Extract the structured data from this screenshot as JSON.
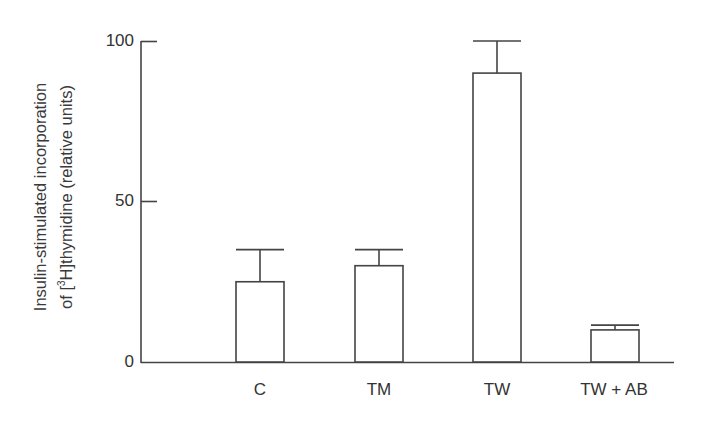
{
  "chart_data": {
    "type": "bar",
    "title": "",
    "xlabel": "",
    "ylabel_line1": "Insulin-stimulated incorporation",
    "ylabel_line2_prefix": "of [",
    "ylabel_sup": "3",
    "ylabel_line2_suffix": "H]thymidine (relative units)",
    "ylabel": "Insulin-stimulated incorporation of [3H]thymidine (relative units)",
    "categories": [
      "C",
      "TM",
      "TW",
      "TW + AB"
    ],
    "values": [
      25,
      30,
      90,
      10
    ],
    "error_upper": [
      35,
      35,
      100,
      11.5
    ],
    "yticks": [
      "0",
      "50",
      "100"
    ],
    "ylim": [
      0,
      100
    ],
    "grid": false,
    "legend": null,
    "bar_fill": "#ffffff",
    "line_color": "#444444"
  }
}
